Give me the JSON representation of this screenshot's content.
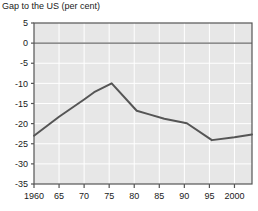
{
  "chart_data": {
    "type": "line",
    "title": "Gap to the US (per cent)",
    "xlabel": "",
    "ylabel": "",
    "ylim": [
      -35,
      5
    ],
    "xlim": [
      1960,
      2003.5
    ],
    "grid": true,
    "legend": false,
    "y_ticks": [
      5,
      0,
      -5,
      -10,
      -15,
      -20,
      -25,
      -30,
      -35
    ],
    "y_tick_labels": [
      "5",
      "0",
      "-5",
      "-10",
      "-15",
      "-20",
      "-25",
      "-30",
      "-35"
    ],
    "x_ticks": [
      1960,
      1965,
      1970,
      1975,
      1980,
      1985,
      1990,
      1995,
      2000
    ],
    "x_tick_labels": [
      "1960",
      "65",
      "70",
      "75",
      "80",
      "85",
      "90",
      "95",
      "2000"
    ],
    "zero_line": 0,
    "series": [
      {
        "name": "Gap to the US",
        "color": "#555555",
        "x": [
          1960,
          1965,
          1970,
          1972,
          1975.5,
          1980.5,
          1983,
          1986,
          1990.5,
          1995.5,
          2000,
          2003.5
        ],
        "values": [
          -23.0,
          -18.3,
          -14.0,
          -12.2,
          -10.0,
          -16.8,
          -17.7,
          -18.8,
          -19.9,
          -24.1,
          -23.4,
          -22.7
        ]
      }
    ]
  },
  "colors": {
    "plot_background": "#e7e7e7",
    "gridline": "#ffffff",
    "axis": "#555555",
    "zero_line": "#6a6a6a",
    "series_line": "#555555",
    "text": "#1a1a1a",
    "page_background": "#ffffff"
  }
}
